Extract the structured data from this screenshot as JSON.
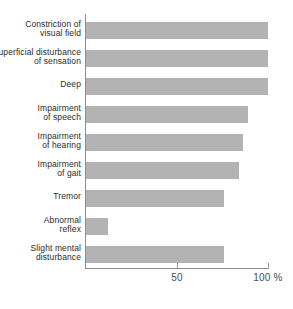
{
  "chart_data": {
    "type": "bar",
    "orientation": "horizontal",
    "title": "",
    "xlabel": "",
    "ylabel": "",
    "xlim": [
      0,
      100
    ],
    "grid": false,
    "legend": null,
    "unit": "%",
    "categories": [
      "Constriction of visual field",
      "Superficial disturbance of sensation",
      "Deep",
      "Impairment of speech",
      "Impairment of hearing",
      "Impairment of gait",
      "Tremor",
      "Abnormal reflex",
      "Slight mental disturbance"
    ],
    "values": [
      100,
      100,
      100,
      89,
      86,
      84,
      76,
      12,
      76
    ],
    "ticks": [
      {
        "value": 50,
        "label": "50"
      },
      {
        "value": 100,
        "label": "100 %"
      }
    ]
  },
  "rows": [
    {
      "lines": [
        "Constriction of",
        "visual field"
      ],
      "value": 100
    },
    {
      "lines": [
        "Superficial disturbance",
        "of sensation"
      ],
      "value": 100
    },
    {
      "lines": [
        "Deep"
      ],
      "value": 100
    },
    {
      "lines": [
        "Impairment",
        "of speech"
      ],
      "value": 89
    },
    {
      "lines": [
        "Impairment",
        "of hearing"
      ],
      "value": 86
    },
    {
      "lines": [
        "Impairment",
        "of gait"
      ],
      "value": 84
    },
    {
      "lines": [
        "Tremor"
      ],
      "value": 76
    },
    {
      "lines": [
        "Abnormal",
        "reflex"
      ],
      "value": 12
    },
    {
      "lines": [
        "Slight mental",
        "disturbance"
      ],
      "value": 76
    }
  ],
  "style": {
    "bar_color": "#b3b3b3",
    "axis_color": "#8c8c8c",
    "label_color": "#2b2b2b",
    "tick_label_color": "#4d4d4d",
    "background": "#ffffff"
  }
}
